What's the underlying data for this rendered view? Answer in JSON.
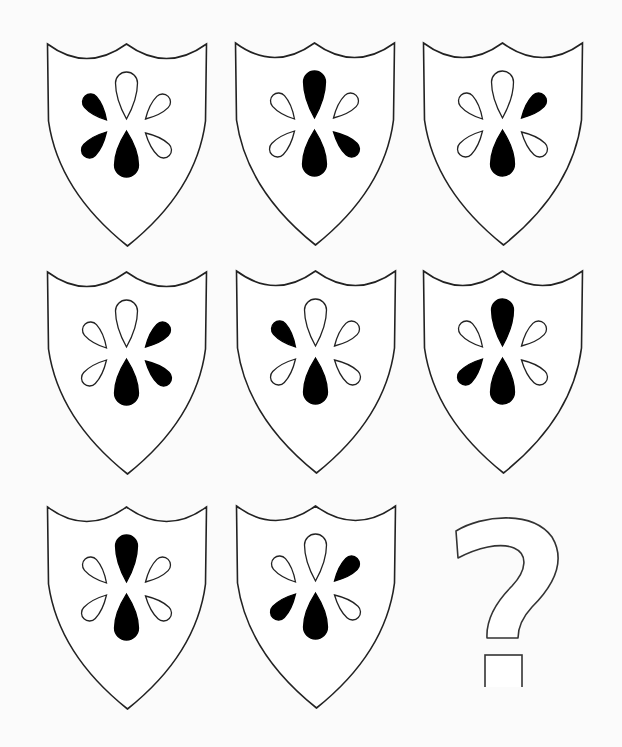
{
  "puzzle": {
    "title": "Shield pattern puzzle",
    "colors": {
      "background": "#fbfbfb",
      "stroke": "#222222",
      "filled": "#000000",
      "empty": "#ffffff"
    },
    "petal_order": [
      "top",
      "upper_left",
      "upper_right",
      "lower_left",
      "lower_right",
      "bottom"
    ],
    "shields": [
      {
        "id": 1,
        "row": 1,
        "col": 1,
        "x": 45,
        "y": 41,
        "petals": {
          "top": "empty",
          "upper_left": "filled",
          "upper_right": "empty",
          "lower_left": "filled",
          "lower_right": "empty",
          "bottom": "filled"
        }
      },
      {
        "id": 2,
        "row": 1,
        "col": 2,
        "x": 233,
        "y": 40,
        "petals": {
          "top": "filled",
          "upper_left": "empty",
          "upper_right": "empty",
          "lower_left": "empty",
          "lower_right": "filled",
          "bottom": "filled"
        }
      },
      {
        "id": 3,
        "row": 1,
        "col": 3,
        "x": 421,
        "y": 40,
        "petals": {
          "top": "empty",
          "upper_left": "empty",
          "upper_right": "filled",
          "lower_left": "empty",
          "lower_right": "empty",
          "bottom": "filled"
        }
      },
      {
        "id": 4,
        "row": 2,
        "col": 1,
        "x": 45,
        "y": 269,
        "petals": {
          "top": "empty",
          "upper_left": "empty",
          "upper_right": "filled",
          "lower_left": "empty",
          "lower_right": "filled",
          "bottom": "filled"
        }
      },
      {
        "id": 5,
        "row": 2,
        "col": 2,
        "x": 234,
        "y": 268,
        "petals": {
          "top": "empty",
          "upper_left": "filled",
          "upper_right": "empty",
          "lower_left": "empty",
          "lower_right": "empty",
          "bottom": "filled"
        }
      },
      {
        "id": 6,
        "row": 2,
        "col": 3,
        "x": 421,
        "y": 268,
        "petals": {
          "top": "filled",
          "upper_left": "empty",
          "upper_right": "empty",
          "lower_left": "filled",
          "lower_right": "empty",
          "bottom": "filled"
        }
      },
      {
        "id": 7,
        "row": 3,
        "col": 1,
        "x": 45,
        "y": 504,
        "petals": {
          "top": "filled",
          "upper_left": "empty",
          "upper_right": "empty",
          "lower_left": "empty",
          "lower_right": "empty",
          "bottom": "filled"
        }
      },
      {
        "id": 8,
        "row": 3,
        "col": 2,
        "x": 234,
        "y": 503,
        "petals": {
          "top": "empty",
          "upper_left": "empty",
          "upper_right": "filled",
          "lower_left": "filled",
          "lower_right": "empty",
          "bottom": "filled"
        }
      }
    ],
    "answer_slot": {
      "row": 3,
      "col": 3,
      "symbol": "?",
      "x": 452,
      "y": 512
    }
  }
}
